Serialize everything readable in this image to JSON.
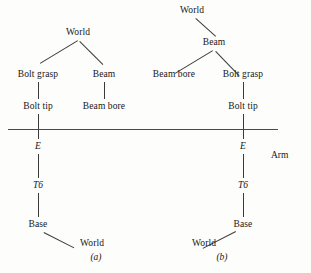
{
  "figure": {
    "title": "",
    "background_color": "#fdfdfc",
    "line_color": "#3a3a3a",
    "text_color": "#171717",
    "arm_label": "Arm",
    "divider_label": "arm-boundary-line"
  },
  "panels": [
    {
      "id": "a",
      "caption": "(a)",
      "nodes": {
        "root": "World",
        "left_child": "Bolt grasp",
        "right_child": "Beam",
        "left_grandchild": "Bolt tip",
        "right_grandchild": "Beam bore",
        "chain_1": "E",
        "chain_2": "T6",
        "chain_3": "Base",
        "chain_4": "World"
      },
      "edges": [
        "World -> Bolt grasp",
        "World -> Beam",
        "Bolt grasp -> Bolt tip",
        "Beam -> Beam bore",
        "Bolt tip -> E",
        "E -> T6",
        "T6 -> Base",
        "Base -> World"
      ]
    },
    {
      "id": "b",
      "caption": "(b)",
      "nodes": {
        "root": "World",
        "child": "Beam",
        "left_grandchild": "Beam bore",
        "right_grandchild": "Bolt grasp",
        "great_grandchild": "Bolt tip",
        "chain_1": "E",
        "chain_2": "T6",
        "chain_3": "Base",
        "chain_4": "World"
      },
      "edges": [
        "World -> Beam",
        "Beam -> Beam bore",
        "Beam -> Bolt grasp",
        "Bolt grasp -> Bolt tip",
        "Bolt tip -> E",
        "E -> T6",
        "T6 -> Base",
        "Base -> World"
      ]
    }
  ]
}
